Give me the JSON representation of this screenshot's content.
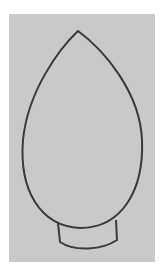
{
  "image": {
    "subject": "pencil outline drawing of a light bulb shape on gray paper",
    "colors": {
      "background": "#ffffff",
      "paper": "#c9c9c9",
      "stroke": "#3a3a3a"
    }
  }
}
